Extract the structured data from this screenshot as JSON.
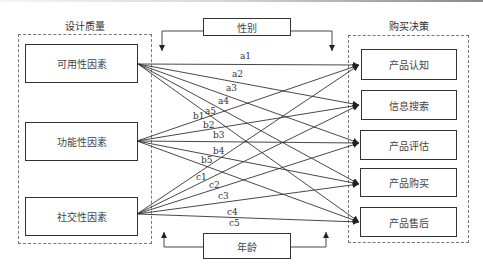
{
  "left_group": {
    "title": "设计质量",
    "items": [
      {
        "label": "可用性因素"
      },
      {
        "label": "功能性因素"
      },
      {
        "label": "社交性因素"
      }
    ]
  },
  "right_group": {
    "title": "购买决策",
    "items": [
      {
        "label": "产品认知"
      },
      {
        "label": "信息搜索"
      },
      {
        "label": "产品评估"
      },
      {
        "label": "产品购买"
      },
      {
        "label": "产品售后"
      }
    ]
  },
  "moderators": {
    "top": {
      "label": "性别"
    },
    "bottom": {
      "label": "年龄"
    }
  },
  "paths": {
    "usability": [
      "a1",
      "a2",
      "a3",
      "a4",
      "a5"
    ],
    "functionality": [
      "b1",
      "b2",
      "b3",
      "b4",
      "b5"
    ],
    "sociality": [
      "c1",
      "c2",
      "c3",
      "c4",
      "c5"
    ]
  },
  "colors": {
    "line": "#333333",
    "dashed_border": "#777777",
    "background": "#ffffff"
  }
}
